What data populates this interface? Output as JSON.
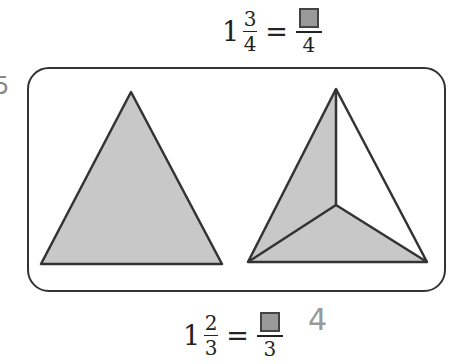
{
  "question_number": "5",
  "top_equation": {
    "whole": "1",
    "numerator": "3",
    "denominator": "4",
    "equals": "=",
    "answer_denominator": "4"
  },
  "bottom_equation": {
    "whole": "1",
    "numerator": "2",
    "denominator": "3",
    "equals": "=",
    "answer_denominator": "3"
  },
  "handwritten_answer": "4",
  "colors": {
    "shape_fill": "#c8c8c8",
    "stroke": "#333333",
    "answer_box": "#9a9a9a"
  },
  "shapes": [
    {
      "name": "whole-triangle",
      "parts": 1,
      "shaded": 1
    },
    {
      "name": "divided-triangle",
      "parts": 3,
      "shaded": 2
    }
  ]
}
